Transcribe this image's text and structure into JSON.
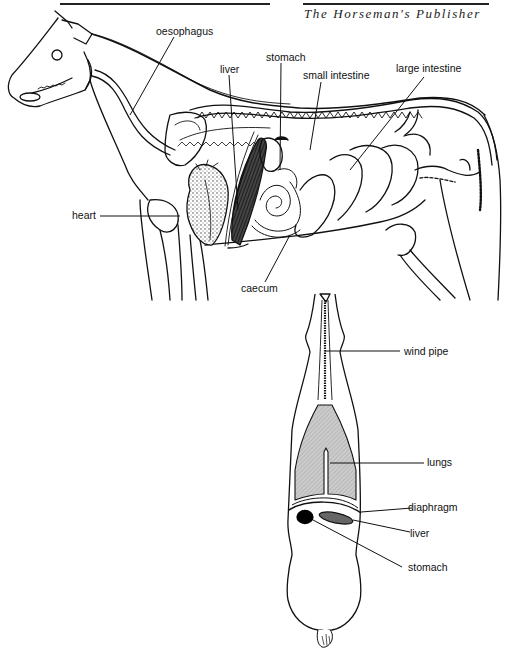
{
  "header": {
    "publisher": "The Horseman's Publisher"
  },
  "side_view": {
    "title": "Horse internal organs — side view",
    "labels": {
      "oesophagus": "oesophagus",
      "stomach": "stomach",
      "liver": "liver",
      "small_intestine": "small intestine",
      "large_intestine": "large intestine",
      "heart": "heart",
      "caecum": "caecum"
    }
  },
  "top_view": {
    "title": "Horse internal organs — top view",
    "labels": {
      "wind_pipe": "wind pipe",
      "lungs": "lungs",
      "diaphragm": "diaphragm",
      "liver": "liver",
      "stomach": "stomach"
    }
  },
  "colors": {
    "line": "#111111",
    "lung_fill": "#bdbdbd",
    "liver_fill": "#555555",
    "stomach_fill": "#000000",
    "background": "#ffffff"
  }
}
